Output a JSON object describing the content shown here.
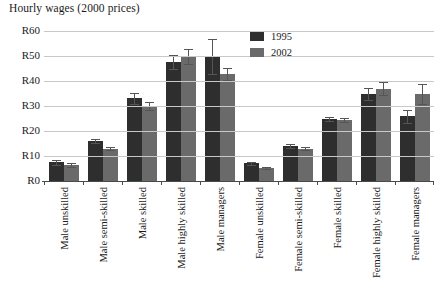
{
  "chart_data": {
    "type": "bar",
    "title": "Hourly wages (2000 prices)",
    "xlabel": "",
    "ylabel": "",
    "ylim": [
      0,
      60
    ],
    "ytick_labels": [
      "R60",
      "R50",
      "R40",
      "R30",
      "R20",
      "R10",
      "R0"
    ],
    "ytick_values": [
      60,
      50,
      40,
      30,
      20,
      10,
      0
    ],
    "grid": true,
    "legend_position": "top-center-right",
    "categories": [
      "Male unskilled",
      "Male semi-skilled",
      "Male skilled",
      "Male highly skilled",
      "Male managers",
      "Female unskilled",
      "Female semi-skilled",
      "Female skilled",
      "Female highly skilled",
      "Female managers"
    ],
    "series": [
      {
        "name": "1995",
        "color": "#2e2e2e",
        "values": [
          7.5,
          16.0,
          33.2,
          47.8,
          50.0,
          7.2,
          14.0,
          25.0,
          35.0,
          26.0
        ],
        "error_low": [
          6.6,
          15.2,
          31.0,
          45.0,
          43.0,
          6.6,
          13.2,
          24.2,
          32.6,
          23.4
        ],
        "error_high": [
          8.4,
          16.8,
          35.4,
          50.6,
          57.0,
          7.8,
          14.8,
          25.8,
          37.4,
          28.6
        ]
      },
      {
        "name": "2002",
        "color": "#6a6a6a",
        "values": [
          6.5,
          13.0,
          30.0,
          50.0,
          43.0,
          5.2,
          13.0,
          24.5,
          37.0,
          35.0
        ],
        "error_low": [
          5.7,
          12.4,
          28.4,
          47.0,
          40.6,
          4.8,
          12.4,
          23.7,
          34.4,
          31.0
        ],
        "error_high": [
          7.3,
          13.6,
          31.6,
          53.0,
          45.4,
          5.6,
          13.6,
          25.3,
          39.6,
          39.0
        ]
      }
    ]
  },
  "legend": {
    "items": [
      {
        "label": "1995"
      },
      {
        "label": "2002"
      }
    ]
  }
}
